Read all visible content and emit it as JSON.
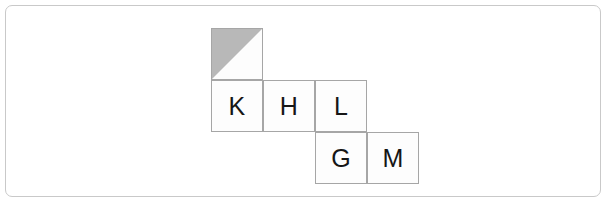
{
  "figure": {
    "type": "cube-net-diagram",
    "frame": {
      "border_color": "#c9c9c9",
      "background_color": "#ffffff"
    },
    "style": {
      "cell_border_color": "#a6a6a6",
      "cell_fill_color": "#fdfdfd",
      "letter_color": "#161616",
      "shade_color": "#b8b8b8",
      "cell_size_px": 52
    },
    "grid": {
      "origin_x": 211,
      "origin_y": 28,
      "cell_size": 52,
      "rows": 3,
      "columns": 4
    },
    "cells": [
      {
        "id": "cell-shaded",
        "label": "",
        "row": 0,
        "col": 0,
        "x": 211,
        "y": 28,
        "w": 52,
        "h": 52,
        "shaded": true,
        "shade_shape": "upper-left-triangle",
        "shade_points": "0,0 100,0 0,100"
      },
      {
        "id": "cell-k",
        "label": "K",
        "row": 1,
        "col": 0,
        "x": 211,
        "y": 80,
        "w": 52,
        "h": 52,
        "shaded": false
      },
      {
        "id": "cell-h",
        "label": "H",
        "row": 1,
        "col": 1,
        "x": 263,
        "y": 80,
        "w": 52,
        "h": 52,
        "shaded": false
      },
      {
        "id": "cell-l",
        "label": "L",
        "row": 1,
        "col": 2,
        "x": 315,
        "y": 80,
        "w": 52,
        "h": 52,
        "shaded": false
      },
      {
        "id": "cell-g",
        "label": "G",
        "row": 2,
        "col": 2,
        "x": 315,
        "y": 132,
        "w": 52,
        "h": 52,
        "shaded": false
      },
      {
        "id": "cell-m",
        "label": "M",
        "row": 2,
        "col": 3,
        "x": 367,
        "y": 132,
        "w": 52,
        "h": 52,
        "shaded": false
      }
    ],
    "letters": [
      "K",
      "H",
      "L",
      "G",
      "M"
    ]
  }
}
